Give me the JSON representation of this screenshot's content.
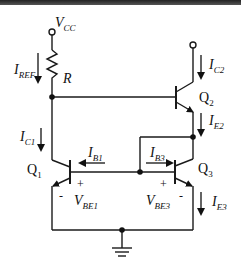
{
  "diagram": {
    "supply": {
      "symbol": "V",
      "sub": "CC"
    },
    "resistor": {
      "label": "R"
    },
    "currents": {
      "iref": {
        "symbol": "I",
        "sub": "REF"
      },
      "ic1": {
        "symbol": "I",
        "sub": "C1"
      },
      "ic2": {
        "symbol": "I",
        "sub": "C2"
      },
      "ie2": {
        "symbol": "I",
        "sub": "E2"
      },
      "ib1": {
        "symbol": "I",
        "sub": "B1"
      },
      "ib3": {
        "symbol": "I",
        "sub": "B3"
      },
      "ie3": {
        "symbol": "I",
        "sub": "E3"
      }
    },
    "transistors": {
      "q1": {
        "symbol": "Q",
        "sub": "1"
      },
      "q2": {
        "symbol": "Q",
        "sub": "2"
      },
      "q3": {
        "symbol": "Q",
        "sub": "3"
      }
    },
    "voltages": {
      "vbe1": {
        "symbol": "V",
        "sub": "BE1",
        "plus": "+",
        "minus": "-"
      },
      "vbe3": {
        "symbol": "V",
        "sub": "BE3",
        "plus": "+",
        "minus": "-"
      }
    },
    "colors": {
      "wire": "#1a1a1a",
      "background": "#ffffff",
      "topbar": "#333333"
    }
  }
}
